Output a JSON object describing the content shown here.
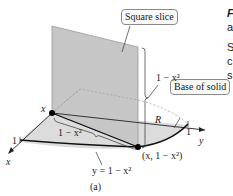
{
  "figure": {
    "caption": "(a)",
    "callouts": {
      "square_slice": "Square slice",
      "base_of_solid": "Base of solid"
    },
    "labels": {
      "slice_height": "1 − x²",
      "slice_width": "1 − x²",
      "region": "R",
      "point": "(x, 1 − x²)",
      "curve": "y = 1 − x²",
      "x_point": "x",
      "x_axis": "x",
      "y_axis": "y",
      "x_tick": "1",
      "y_tick": "1"
    },
    "colors": {
      "slice_fill": "#c9c9c9",
      "base_fill": "#d8d8d8",
      "curve": "#1a1a1a",
      "point": "#000000"
    }
  },
  "side_text": {
    "line1": "F",
    "line2": "a",
    "line3": "S",
    "line4": "c",
    "line5": "s"
  }
}
